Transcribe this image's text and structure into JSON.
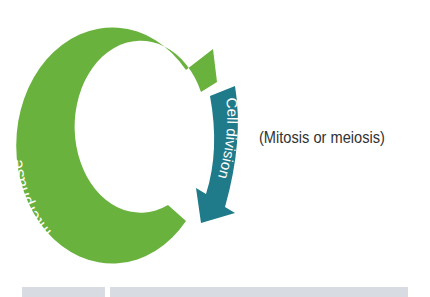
{
  "diagram": {
    "phases": [
      {
        "name": "Interphase",
        "color": "#6ab23e"
      },
      {
        "name": "Cell division",
        "color": "#1f7a8a"
      }
    ],
    "note": "(Mitosis or meiosis)"
  }
}
